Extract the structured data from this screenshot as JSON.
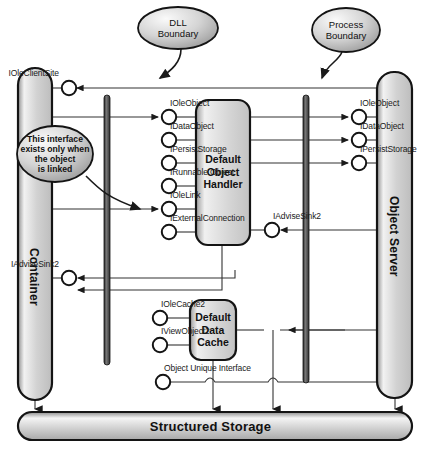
{
  "diagram": {
    "callouts": [
      {
        "id": "dll-boundary",
        "label": "DLL\nBoundary",
        "cx": 178,
        "cy": 28,
        "rx": 40,
        "ry": 21
      },
      {
        "id": "process-boundary",
        "label": "Process\nBoundary",
        "cx": 346,
        "cy": 30,
        "rx": 34,
        "ry": 22
      },
      {
        "id": "link-note",
        "label": "This interface\nexists only when\nthe object\nis linked",
        "cx": 55,
        "cy": 154,
        "rx": 38,
        "ry": 28
      }
    ],
    "pillars": [
      {
        "id": "container",
        "label": "Container",
        "x": 18,
        "y": 68,
        "w": 34,
        "h": 332
      },
      {
        "id": "object-server",
        "label": "Object Server",
        "x": 377,
        "y": 72,
        "w": 35,
        "h": 326
      }
    ],
    "boundaries": [
      {
        "id": "dll-boundary-bar",
        "x": 104,
        "y": 95,
        "w": 6,
        "h": 270
      },
      {
        "id": "process-boundary-bar",
        "x": 303,
        "y": 95,
        "w": 6,
        "h": 288
      }
    ],
    "components": [
      {
        "id": "default-object-handler",
        "label": "Default\nObject\nHandler",
        "x": 196,
        "y": 100,
        "w": 54,
        "h": 145
      },
      {
        "id": "default-data-cache",
        "label": "Default\nData\nCache",
        "x": 190,
        "y": 300,
        "w": 46,
        "h": 60
      }
    ],
    "storage": {
      "id": "structured-storage",
      "label": "Structured Storage",
      "x": 18,
      "y": 412,
      "w": 394,
      "h": 28
    },
    "interfaces": [
      {
        "id": "iface-ioleclientsite",
        "name": "IOleClientSite",
        "cx": 69,
        "cy": 88,
        "label_x": 59,
        "label_y": 68,
        "align": "left"
      },
      {
        "id": "iface-ioleobject-left",
        "name": "IOleObject",
        "cx": 169,
        "cy": 117,
        "label_x": 170,
        "label_y": 98,
        "align": "right"
      },
      {
        "id": "iface-idataobject-left",
        "name": "IDataObject",
        "cx": 169,
        "cy": 140,
        "label_x": 170,
        "label_y": 121,
        "align": "right"
      },
      {
        "id": "iface-ipersiststorage-left",
        "name": "IPersistStorage",
        "cx": 169,
        "cy": 163,
        "label_x": 170,
        "label_y": 144,
        "align": "right"
      },
      {
        "id": "iface-irunnableobject",
        "name": "IRunnable Object",
        "cx": 169,
        "cy": 186,
        "label_x": 170,
        "label_y": 167,
        "align": "right"
      },
      {
        "id": "iface-iolelink",
        "name": "IOleLink",
        "cx": 169,
        "cy": 209,
        "label_x": 170,
        "label_y": 190,
        "align": "right"
      },
      {
        "id": "iface-iexternalconnection",
        "name": "IExternalConnection",
        "cx": 169,
        "cy": 232,
        "label_x": 170,
        "label_y": 213,
        "align": "right"
      },
      {
        "id": "iface-ioleobject-right",
        "name": "IOleObject",
        "cx": 359,
        "cy": 117,
        "label_x": 360,
        "label_y": 98,
        "align": "right"
      },
      {
        "id": "iface-idataobject-right",
        "name": "IDataObject",
        "cx": 359,
        "cy": 140,
        "label_x": 360,
        "label_y": 121,
        "align": "right"
      },
      {
        "id": "iface-ipersiststorage-right",
        "name": "IPersistStorage",
        "cx": 359,
        "cy": 163,
        "label_x": 360,
        "label_y": 144,
        "align": "right"
      },
      {
        "id": "iface-iadvisesink2-handler",
        "name": "IAdviseSink2",
        "cx": 272,
        "cy": 230,
        "label_x": 273,
        "label_y": 211,
        "align": "right"
      },
      {
        "id": "iface-iadvisesink2-container",
        "name": "IAdviseSink2",
        "cx": 69,
        "cy": 278,
        "label_x": 59,
        "label_y": 259,
        "align": "left"
      },
      {
        "id": "iface-iolecache2",
        "name": "IOleCache2",
        "cx": 160,
        "cy": 318,
        "label_x": 161,
        "label_y": 299,
        "align": "right"
      },
      {
        "id": "iface-iviewobject2",
        "name": "IViewObject2",
        "cx": 160,
        "cy": 345,
        "label_x": 161,
        "label_y": 326,
        "align": "right"
      },
      {
        "id": "iface-object-unique",
        "name": "Object Unique Interface",
        "cx": 163,
        "cy": 382,
        "label_x": 164,
        "label_y": 363,
        "align": "right"
      }
    ],
    "colors": {
      "fill_light": "#e8e8e8",
      "fill_mid": "#c9c9c9",
      "fill_dark": "#9a9a9a",
      "stroke": "#1a1a1a",
      "line": "#333333",
      "bar": "#4a4a4a"
    }
  }
}
